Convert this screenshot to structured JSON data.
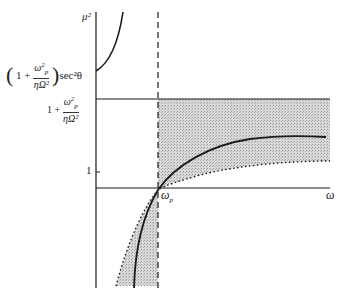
{
  "diagram": {
    "axis_labels": {
      "y": "μ²",
      "x": "ω"
    },
    "tick_labels": {
      "one": "1",
      "omega_p": "ω",
      "omega_p_sub": "p"
    },
    "upper_label": {
      "prefix": "1 +",
      "num": "ω",
      "num_sub": "p",
      "num_sup": "2",
      "den": "ηΩ²",
      "suffix": "sec²θ"
    },
    "middle_label": {
      "prefix": "1 +",
      "num": "ω",
      "num_sub": "p",
      "num_sup": "2",
      "den": "ηΩ²"
    },
    "colors": {
      "line": "#1a1a1a",
      "shade": "#cfcfcf"
    }
  }
}
